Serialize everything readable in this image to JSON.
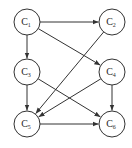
{
  "diagram": {
    "type": "directed-graph",
    "node_radius": 13,
    "stroke_color": "#333333",
    "nodes": [
      {
        "id": "C1",
        "base": "C",
        "sub": "1",
        "x": 27,
        "y": 22
      },
      {
        "id": "C2",
        "base": "C",
        "sub": "2",
        "x": 112,
        "y": 22
      },
      {
        "id": "C3",
        "base": "C",
        "sub": "3",
        "x": 27,
        "y": 72
      },
      {
        "id": "C4",
        "base": "C",
        "sub": "4",
        "x": 112,
        "y": 72
      },
      {
        "id": "C5",
        "base": "C",
        "sub": "5",
        "x": 27,
        "y": 124
      },
      {
        "id": "C6",
        "base": "C",
        "sub": "6",
        "x": 112,
        "y": 124
      }
    ],
    "edges": [
      {
        "from": "C1",
        "to": "C2"
      },
      {
        "from": "C1",
        "to": "C3"
      },
      {
        "from": "C1",
        "to": "C4"
      },
      {
        "from": "C2",
        "to": "C5"
      },
      {
        "from": "C3",
        "to": "C5"
      },
      {
        "from": "C3",
        "to": "C6"
      },
      {
        "from": "C4",
        "to": "C5"
      },
      {
        "from": "C4",
        "to": "C6"
      },
      {
        "from": "C5",
        "to": "C6"
      }
    ]
  }
}
